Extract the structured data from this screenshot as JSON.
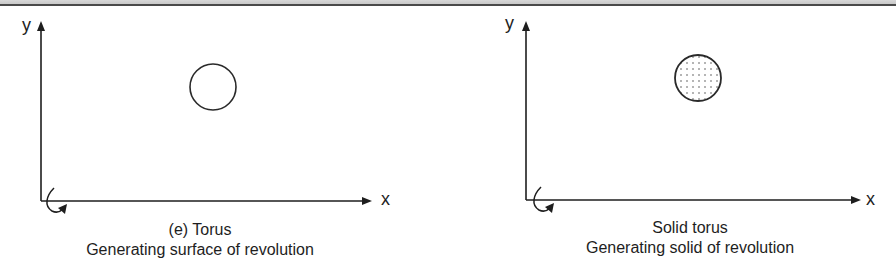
{
  "panels": [
    {
      "id": "torus-surface",
      "axes": {
        "y_label": "y",
        "x_label": "x"
      },
      "generator": {
        "shape": "circle",
        "fill": "none"
      },
      "caption": {
        "title": "(e) Torus",
        "subtitle": "Generating surface of revolution"
      }
    },
    {
      "id": "solid-torus",
      "axes": {
        "y_label": "y",
        "x_label": "x"
      },
      "generator": {
        "shape": "circle",
        "fill": "dotted"
      },
      "caption": {
        "title": "Solid torus",
        "subtitle": "Generating solid of revolution"
      }
    }
  ],
  "colors": {
    "ink": "#1e1e1e",
    "header_band": "#d0d0d0",
    "header_rule": "#4a4a4a"
  }
}
